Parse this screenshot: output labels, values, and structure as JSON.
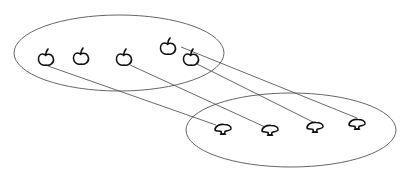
{
  "diagram": {
    "type": "set-mapping",
    "colors": {
      "background": "#ffffff",
      "ellipse_stroke": "#555555",
      "line_stroke": "#444444",
      "sketch_stroke": "#111111"
    },
    "sets": [
      {
        "id": "domain",
        "name": "apples",
        "ellipse": {
          "cx": 119,
          "cy": 53,
          "rx": 105,
          "ry": 38
        },
        "elements": [
          {
            "id": "apple-1",
            "icon": "apple-icon",
            "x": 46,
            "y": 58
          },
          {
            "id": "apple-2",
            "icon": "apple-icon",
            "x": 81,
            "y": 57
          },
          {
            "id": "apple-3",
            "icon": "apple-icon",
            "x": 124,
            "y": 58
          },
          {
            "id": "apple-4",
            "icon": "apple-icon",
            "x": 168,
            "y": 47
          },
          {
            "id": "apple-5",
            "icon": "apple-icon",
            "x": 191,
            "y": 58
          }
        ]
      },
      {
        "id": "codomain",
        "name": "mushrooms",
        "ellipse": {
          "cx": 291,
          "cy": 130,
          "rx": 105,
          "ry": 37
        },
        "elements": [
          {
            "id": "mushroom-1",
            "icon": "mushroom-icon",
            "x": 223,
            "y": 129
          },
          {
            "id": "mushroom-2",
            "icon": "mushroom-icon",
            "x": 270,
            "y": 130
          },
          {
            "id": "mushroom-3",
            "icon": "mushroom-icon",
            "x": 315,
            "y": 127
          },
          {
            "id": "mushroom-4",
            "icon": "mushroom-icon",
            "x": 357,
            "y": 124
          }
        ]
      }
    ],
    "mappings": [
      {
        "from": "apple-1",
        "to": "mushroom-1",
        "x1": 48,
        "y1": 66,
        "x2": 216,
        "y2": 125
      },
      {
        "from": "apple-3",
        "to": "mushroom-2",
        "x1": 130,
        "y1": 65,
        "x2": 265,
        "y2": 127
      },
      {
        "from": "apple-5",
        "to": "mushroom-3",
        "x1": 197,
        "y1": 64,
        "x2": 313,
        "y2": 122
      },
      {
        "from": "apple-4",
        "to": "mushroom-4",
        "x1": 181,
        "y1": 47,
        "x2": 357,
        "y2": 118
      }
    ]
  }
}
